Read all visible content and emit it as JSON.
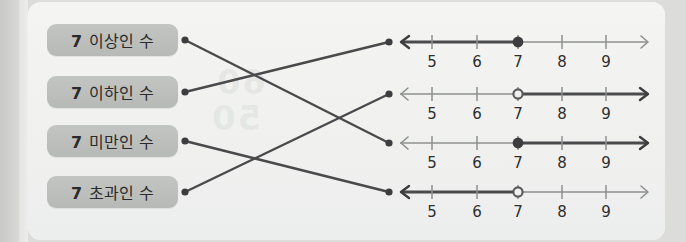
{
  "page": {
    "background_color": "#dcdcda",
    "card_color": "#f2f3f1",
    "pill_color": "#bdbfbd",
    "line_color": "#4a4a4c",
    "axis_color": "#8e9090"
  },
  "ghost_text": {
    "a": "50",
    "b": "60"
  },
  "labels": [
    {
      "id": "label-1",
      "number": "7",
      "text": "이상인 수",
      "full": "7 이상인 수",
      "meaning": "greater-than-or-equal-to-7",
      "y": 40
    },
    {
      "id": "label-2",
      "number": "7",
      "text": "이하인 수",
      "full": "7 이하인 수",
      "meaning": "less-than-or-equal-to-7",
      "y": 92
    },
    {
      "id": "label-3",
      "number": "7",
      "text": "미만인 수",
      "full": "7 미만인 수",
      "meaning": "less-than-7",
      "y": 141
    },
    {
      "id": "label-4",
      "number": "7",
      "text": "초과인 수",
      "full": "7 초과인 수",
      "meaning": "greater-than-7",
      "y": 192
    }
  ],
  "number_lines": [
    {
      "id": "numberline-1",
      "y": 42,
      "tick_labels": [
        "5",
        "6",
        "7",
        "8",
        "9"
      ],
      "endpoint_value": "7",
      "endpoint_style": "filled",
      "shaded_direction": "left",
      "represents": "less-than-or-equal-to-7"
    },
    {
      "id": "numberline-2",
      "y": 94,
      "tick_labels": [
        "5",
        "6",
        "7",
        "8",
        "9"
      ],
      "endpoint_value": "7",
      "endpoint_style": "open",
      "shaded_direction": "right",
      "represents": "greater-than-7"
    },
    {
      "id": "numberline-3",
      "y": 143,
      "tick_labels": [
        "5",
        "6",
        "7",
        "8",
        "9"
      ],
      "endpoint_value": "7",
      "endpoint_style": "filled",
      "shaded_direction": "right",
      "represents": "greater-than-or-equal-to-7"
    },
    {
      "id": "numberline-4",
      "y": 192,
      "tick_labels": [
        "5",
        "6",
        "7",
        "8",
        "9"
      ],
      "endpoint_value": "7",
      "endpoint_style": "open",
      "shaded_direction": "left",
      "represents": "less-than-7"
    }
  ],
  "connections": [
    {
      "id": "connector-1",
      "from_label": 1,
      "to_number_line": 3,
      "x1": 185,
      "y1": 40,
      "x2": 389,
      "y2": 143
    },
    {
      "id": "connector-2",
      "from_label": 2,
      "to_number_line": 1,
      "x1": 185,
      "y1": 92,
      "x2": 389,
      "y2": 42
    },
    {
      "id": "connector-3",
      "from_label": 3,
      "to_number_line": 4,
      "x1": 185,
      "y1": 141,
      "x2": 389,
      "y2": 192
    },
    {
      "id": "connector-4",
      "from_label": 4,
      "to_number_line": 2,
      "x1": 185,
      "y1": 192,
      "x2": 389,
      "y2": 94
    }
  ],
  "axis_geometry": {
    "left_arrow_x": 400,
    "right_arrow_x": 648,
    "tick_x": [
      432,
      477,
      518,
      562,
      606
    ]
  }
}
